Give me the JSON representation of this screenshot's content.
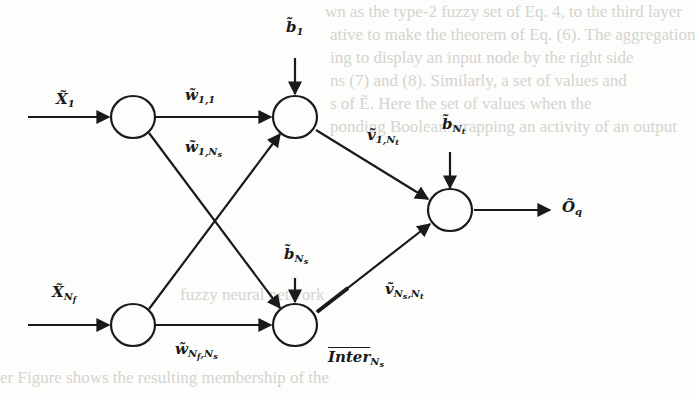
{
  "diagram": {
    "type": "fuzzy-neural-network",
    "colors": {
      "stroke": "#1a1a1a",
      "background": "#fdfdfb",
      "bleed_text": "#d4d4d0"
    },
    "nodes": [
      {
        "id": "input-1",
        "layer": "input",
        "cx": 133,
        "cy": 117
      },
      {
        "id": "input-nf",
        "layer": "input",
        "cx": 133,
        "cy": 325
      },
      {
        "id": "hidden-1",
        "layer": "hidden",
        "cx": 295,
        "cy": 117
      },
      {
        "id": "hidden-ns",
        "layer": "hidden",
        "cx": 295,
        "cy": 325
      },
      {
        "id": "output",
        "layer": "output",
        "cx": 450,
        "cy": 210
      }
    ],
    "labels": {
      "input_1": {
        "base": "X̃",
        "sub": "1"
      },
      "input_nf": {
        "base": "X̃",
        "sub": "N",
        "subsub": "f"
      },
      "weight_1_1": {
        "base": "w̃",
        "sub": "1,1"
      },
      "weight_1_ns": {
        "base": "w̃",
        "sub": "1,N",
        "subsub": "s"
      },
      "weight_nf_ns": {
        "base": "w̃",
        "sub": "N",
        "subsub": "f",
        "sub2": ",N",
        "subsub2": "s"
      },
      "bias_1": {
        "base": "b̃",
        "sub": "1"
      },
      "bias_ns": {
        "base": "b̃",
        "sub": "N",
        "subsub": "s"
      },
      "bias_nt": {
        "base": "b̃",
        "sub": "N",
        "subsub": "t"
      },
      "v_1_nt": {
        "base": "ṽ",
        "sub": "1,N",
        "subsub": "t"
      },
      "v_ns_nt": {
        "base": "ṽ",
        "sub": "N",
        "subsub": "s",
        "sub2": ",N",
        "subsub2": "t"
      },
      "inter_ns": {
        "base": "Inter",
        "sub": "N",
        "subsub": "s"
      },
      "output": {
        "base": "Õ",
        "sub": "q"
      }
    },
    "bleed_through_text": [
      "wn as the type-2 fuzzy set of Eq. 4, to the third layer",
      "ative to make the theorem of Eq. (6). The aggregation",
      "ing to display an input node by the right side",
      "ns (7) and (8). Similarly, a set of values and",
      "s of Ẽ. Here the set of values when the",
      "ponding Boolean wrapping an activity of an output",
      "fuzzy neural network",
      "er Figure shows the resulting membership of the",
      "input/output values contain an alpha-cut of the"
    ]
  }
}
